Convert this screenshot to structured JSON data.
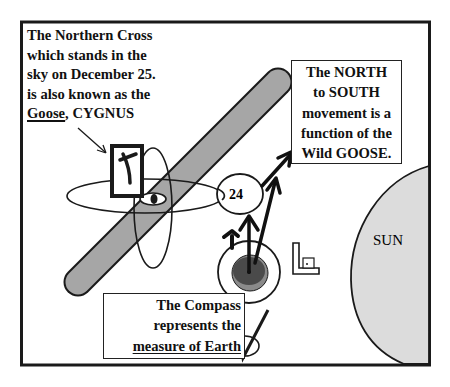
{
  "diagram": {
    "title_caption": {
      "lines": [
        "The Northern Cross",
        "which stands in the",
        "sky on December 25.",
        "is also known as the"
      ],
      "last_line_underlined": "Goose",
      "last_line_rest": ", CYGNUS"
    },
    "north_south_box": {
      "lines": [
        "The NORTH",
        "to SOUTH",
        "movement is a",
        "function of the",
        "Wild GOOSE."
      ]
    },
    "compass_box": {
      "lines": [
        "The Compass",
        "represents the"
      ],
      "underlined_line": "measure of Earth"
    },
    "labels": {
      "circle_number": "24",
      "sun": "SUN"
    },
    "symbols": [
      "northern-cross-card",
      "milky-way-band",
      "orbit-ellipses",
      "eye-ellipse",
      "earth-target",
      "square-tool",
      "compass-tool",
      "arrows"
    ],
    "colors": {
      "frame": "#1a1a1a",
      "band_fill": "#a6a6a6",
      "sun_fill": "#dcdcdc",
      "earth_outer": "#8a8a8a",
      "earth_inner": "#4a4a4a",
      "background": "#ffffff"
    }
  }
}
